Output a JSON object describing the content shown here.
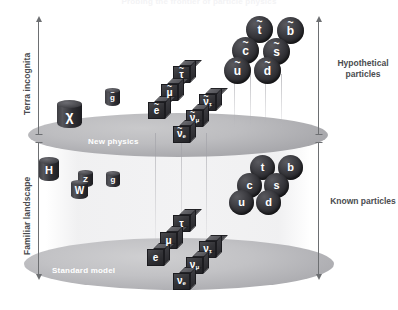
{
  "header": {
    "title": "Probing the frontier of particle physics"
  },
  "axes": {
    "left_top_label": "Terra incognita",
    "left_bottom_label": "Familiar landscape",
    "right_top_label_line1": "Hypothetical",
    "right_top_label_line2": "particles",
    "right_bottom_label": "Known particles"
  },
  "planes": {
    "top": {
      "label": "New physics"
    },
    "bottom": {
      "label": "Standard model"
    }
  },
  "colors": {
    "background": "#ffffff",
    "plane_fill": "#bdbdc0",
    "particle_dark": "#2a2a2e",
    "axis": "#6d6f72",
    "label_text": "#4a4c4f",
    "plane_label_text": "#ffffff"
  },
  "hypothetical": {
    "squarks": [
      {
        "name": "stop",
        "base": "t",
        "tilde": true,
        "x": 246,
        "y": 16,
        "d": 27
      },
      {
        "name": "sbottom",
        "base": "b",
        "tilde": true,
        "x": 277,
        "y": 17,
        "d": 27
      },
      {
        "name": "scharm",
        "base": "c",
        "tilde": true,
        "x": 232,
        "y": 37,
        "d": 27
      },
      {
        "name": "sstrange",
        "base": "s",
        "tilde": true,
        "x": 263,
        "y": 38,
        "d": 27
      },
      {
        "name": "sup",
        "base": "u",
        "tilde": true,
        "x": 224,
        "y": 57,
        "d": 27
      },
      {
        "name": "sdown",
        "base": "d",
        "tilde": true,
        "x": 254,
        "y": 57,
        "d": 27
      }
    ],
    "sleptons": [
      {
        "name": "stau",
        "base": "τ",
        "tilde": true,
        "sub": "",
        "x": 173,
        "y": 60,
        "s": 17
      },
      {
        "name": "smuon",
        "base": "μ",
        "tilde": true,
        "sub": "",
        "x": 161,
        "y": 78,
        "s": 17
      },
      {
        "name": "selectron",
        "base": "e",
        "tilde": true,
        "sub": "",
        "x": 148,
        "y": 96,
        "s": 17
      },
      {
        "name": "sneutrino-tau",
        "base": "ν",
        "tilde": true,
        "sub": "τ",
        "x": 199,
        "y": 88,
        "s": 17
      },
      {
        "name": "sneutrino-muon",
        "base": "ν",
        "tilde": true,
        "sub": "μ",
        "x": 186,
        "y": 104,
        "s": 17
      },
      {
        "name": "sneutrino-electron",
        "base": "ν",
        "tilde": true,
        "sub": "e",
        "x": 173,
        "y": 120,
        "s": 17
      }
    ],
    "bosons": [
      {
        "name": "neutralino",
        "base": "χ",
        "tilde": false,
        "x": 57,
        "y": 100,
        "w": 25,
        "h": 28
      },
      {
        "name": "gluino",
        "base": "g",
        "tilde": true,
        "x": 105,
        "y": 88,
        "w": 15,
        "h": 18
      }
    ]
  },
  "known": {
    "quarks": [
      {
        "name": "top",
        "base": "t",
        "x": 250,
        "y": 155,
        "d": 25
      },
      {
        "name": "bottom",
        "base": "b",
        "x": 278,
        "y": 155,
        "d": 25
      },
      {
        "name": "charm",
        "base": "c",
        "x": 237,
        "y": 173,
        "d": 25
      },
      {
        "name": "strange",
        "base": "s",
        "x": 264,
        "y": 173,
        "d": 25
      },
      {
        "name": "up",
        "base": "u",
        "x": 229,
        "y": 190,
        "d": 25
      },
      {
        "name": "down",
        "base": "d",
        "x": 256,
        "y": 190,
        "d": 25
      }
    ],
    "leptons": [
      {
        "name": "tau",
        "base": "τ",
        "sub": "",
        "x": 173,
        "y": 209,
        "s": 17
      },
      {
        "name": "muon",
        "base": "μ",
        "sub": "",
        "x": 160,
        "y": 226,
        "s": 17
      },
      {
        "name": "electron",
        "base": "e",
        "sub": "",
        "x": 147,
        "y": 243,
        "s": 17
      },
      {
        "name": "neutrino-tau",
        "base": "ν",
        "sub": "τ",
        "x": 199,
        "y": 235,
        "s": 17
      },
      {
        "name": "neutrino-muon",
        "base": "ν",
        "sub": "μ",
        "x": 186,
        "y": 251,
        "s": 17
      },
      {
        "name": "neutrino-electron",
        "base": "ν",
        "sub": "e",
        "x": 173,
        "y": 267,
        "s": 17
      }
    ],
    "bosons": [
      {
        "name": "higgs",
        "base": "H",
        "x": 39,
        "y": 157,
        "w": 20,
        "h": 24
      },
      {
        "name": "zboson",
        "base": "Z",
        "x": 78,
        "y": 170,
        "w": 15,
        "h": 17
      },
      {
        "name": "wboson",
        "base": "W",
        "x": 71,
        "y": 180,
        "w": 17,
        "h": 19
      },
      {
        "name": "gluon",
        "base": "g",
        "x": 106,
        "y": 171,
        "w": 14,
        "h": 16
      }
    ]
  },
  "droplines": [
    {
      "x": 234,
      "y": 74,
      "h": 54
    },
    {
      "x": 250,
      "y": 74,
      "h": 54
    },
    {
      "x": 265,
      "y": 74,
      "h": 54
    },
    {
      "x": 281,
      "y": 74,
      "h": 54
    },
    {
      "x": 155,
      "y": 133,
      "h": 110
    },
    {
      "x": 181,
      "y": 133,
      "h": 110
    },
    {
      "x": 206,
      "y": 133,
      "h": 110
    }
  ]
}
